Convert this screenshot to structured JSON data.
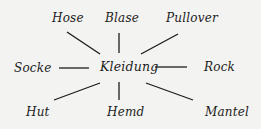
{
  "diagram": {
    "type": "word-web",
    "center": {
      "label": "Kleidung",
      "x": 100,
      "y": 60
    },
    "nodes": [
      {
        "label": "Hose",
        "x": 52,
        "y": 11
      },
      {
        "label": "Blase",
        "x": 105,
        "y": 11
      },
      {
        "label": "Pullover",
        "x": 166,
        "y": 11
      },
      {
        "label": "Socke",
        "x": 14,
        "y": 61
      },
      {
        "label": "Rock",
        "x": 204,
        "y": 60
      },
      {
        "label": "Hut",
        "x": 26,
        "y": 105
      },
      {
        "label": "Hemd",
        "x": 107,
        "y": 105
      },
      {
        "label": "Mantel",
        "x": 205,
        "y": 105
      }
    ],
    "edges": [
      {
        "to": "Hose",
        "x1": 67,
        "y1": 32,
        "x2": 100,
        "y2": 54
      },
      {
        "to": "Blase",
        "x1": 119,
        "y1": 33,
        "x2": 119,
        "y2": 53
      },
      {
        "to": "Pullover",
        "x1": 178,
        "y1": 34,
        "x2": 141,
        "y2": 54
      },
      {
        "to": "Socke",
        "x1": 59,
        "y1": 68,
        "x2": 89,
        "y2": 68
      },
      {
        "to": "Rock",
        "x1": 155,
        "y1": 67,
        "x2": 187,
        "y2": 67
      },
      {
        "to": "Hut",
        "x1": 54,
        "y1": 100,
        "x2": 100,
        "y2": 83
      },
      {
        "to": "Hemd",
        "x1": 119,
        "y1": 82,
        "x2": 119,
        "y2": 100
      },
      {
        "to": "Mantel",
        "x1": 146,
        "y1": 83,
        "x2": 193,
        "y2": 100
      }
    ],
    "colors": {
      "background": "#f3f3f1",
      "ink": "#1c1c1c"
    }
  }
}
